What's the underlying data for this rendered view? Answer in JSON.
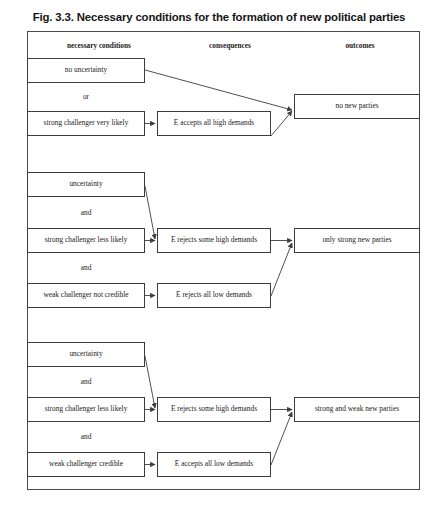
{
  "figure": {
    "title": "Fig. 3.3. Necessary conditions for the formation of new political parties"
  },
  "columns": [
    {
      "id": "necessary-conditions",
      "label": "necessary conditions",
      "x": 44,
      "y": 41,
      "w": 110
    },
    {
      "id": "consequences",
      "label": "consequences",
      "x": 175,
      "y": 41,
      "w": 110
    },
    {
      "id": "outcomes",
      "label": "outcomes",
      "x": 305,
      "y": 41,
      "w": 110
    }
  ],
  "frame": {
    "x": 27,
    "y": 31,
    "w": 393,
    "h": 459
  },
  "groups": [
    {
      "id": "group-1",
      "conditions": [
        {
          "id": "no-uncertainty",
          "text": "no uncertainty",
          "x": 27,
          "y": 58,
          "w": 118,
          "h": 25
        },
        {
          "id": "strong-challenger-very-likely",
          "text": "strong challenger very likely",
          "x": 27,
          "y": 111,
          "w": 118,
          "h": 25
        }
      ],
      "connector": {
        "id": "or-1",
        "text": "or",
        "x": 27,
        "y": 83,
        "w": 118,
        "h": 28
      },
      "consequences": [
        {
          "id": "e-accepts-all-high-demands",
          "text": "E accepts all high demands",
          "x": 157,
          "y": 111,
          "w": 114,
          "h": 25
        }
      ],
      "outcomes": [
        {
          "id": "no-new-parties",
          "text": "no new parties",
          "x": 294,
          "y": 94,
          "w": 126,
          "h": 25
        }
      ]
    },
    {
      "id": "group-2",
      "conditions": [
        {
          "id": "uncertainty-2",
          "text": "uncertainty",
          "x": 27,
          "y": 172,
          "w": 118,
          "h": 25
        },
        {
          "id": "strong-challenger-less-likely-2",
          "text": "strong challenger less likely",
          "x": 27,
          "y": 228,
          "w": 118,
          "h": 25
        },
        {
          "id": "weak-challenger-not-credible",
          "text": "weak challenger not credible",
          "x": 27,
          "y": 283,
          "w": 118,
          "h": 25
        }
      ],
      "connectors": [
        {
          "id": "and-2a",
          "text": "and",
          "x": 27,
          "y": 197,
          "w": 118,
          "h": 31
        },
        {
          "id": "and-2b",
          "text": "and",
          "x": 27,
          "y": 253,
          "w": 118,
          "h": 30
        }
      ],
      "consequences": [
        {
          "id": "e-rejects-some-high-demands-2",
          "text": "E rejects some high demands",
          "x": 157,
          "y": 228,
          "w": 114,
          "h": 25
        },
        {
          "id": "e-rejects-all-low-demands",
          "text": "E rejects all low demands",
          "x": 157,
          "y": 283,
          "w": 114,
          "h": 25
        }
      ],
      "outcomes": [
        {
          "id": "only-strong-new-parties",
          "text": "only strong new parties",
          "x": 294,
          "y": 228,
          "w": 126,
          "h": 25
        }
      ]
    },
    {
      "id": "group-3",
      "conditions": [
        {
          "id": "uncertainty-3",
          "text": "uncertainty",
          "x": 27,
          "y": 342,
          "w": 118,
          "h": 25
        },
        {
          "id": "strong-challenger-less-likely-3",
          "text": "strong challenger less likely",
          "x": 27,
          "y": 397,
          "w": 118,
          "h": 25
        },
        {
          "id": "weak-challenger-credible",
          "text": "weak challenger credible",
          "x": 27,
          "y": 452,
          "w": 118,
          "h": 25
        }
      ],
      "connectors": [
        {
          "id": "and-3a",
          "text": "and",
          "x": 27,
          "y": 367,
          "w": 118,
          "h": 30
        },
        {
          "id": "and-3b",
          "text": "and",
          "x": 27,
          "y": 422,
          "w": 118,
          "h": 30
        }
      ],
      "consequences": [
        {
          "id": "e-rejects-some-high-demands-3",
          "text": "E rejects some high demands",
          "x": 157,
          "y": 397,
          "w": 114,
          "h": 25
        },
        {
          "id": "e-accepts-all-low-demands",
          "text": "E accepts all low demands",
          "x": 157,
          "y": 452,
          "w": 114,
          "h": 25
        }
      ],
      "outcomes": [
        {
          "id": "strong-and-weak-new-parties",
          "text": "strong and weak new parties",
          "x": 294,
          "y": 397,
          "w": 126,
          "h": 25
        }
      ]
    }
  ],
  "edges": [
    {
      "id": "edge-no-uncertainty-to-no-new-parties",
      "from": "no-uncertainty",
      "to": "no-new-parties"
    },
    {
      "id": "edge-strong-very-likely-to-accepts-high",
      "from": "strong-challenger-very-likely",
      "to": "e-accepts-all-high-demands"
    },
    {
      "id": "edge-accepts-high-to-no-new-parties",
      "from": "e-accepts-all-high-demands",
      "to": "no-new-parties"
    },
    {
      "id": "edge-uncertainty2-to-rejects-some-high",
      "from": "uncertainty-2",
      "to": "e-rejects-some-high-demands-2"
    },
    {
      "id": "edge-strong-less-likely2-to-rejects-some-high",
      "from": "strong-challenger-less-likely-2",
      "to": "e-rejects-some-high-demands-2"
    },
    {
      "id": "edge-weak-not-credible-to-rejects-all-low",
      "from": "weak-challenger-not-credible",
      "to": "e-rejects-all-low-demands"
    },
    {
      "id": "edge-rejects-some-high-to-only-strong",
      "from": "e-rejects-some-high-demands-2",
      "to": "only-strong-new-parties"
    },
    {
      "id": "edge-rejects-all-low-to-only-strong",
      "from": "e-rejects-all-low-demands",
      "to": "only-strong-new-parties"
    },
    {
      "id": "edge-uncertainty3-to-rejects-some-high",
      "from": "uncertainty-3",
      "to": "e-rejects-some-high-demands-3"
    },
    {
      "id": "edge-strong-less-likely3-to-rejects-some-high",
      "from": "strong-challenger-less-likely-3",
      "to": "e-rejects-some-high-demands-3"
    },
    {
      "id": "edge-weak-credible-to-accepts-all-low",
      "from": "weak-challenger-credible",
      "to": "e-accepts-all-low-demands"
    },
    {
      "id": "edge-rejects-some-high3-to-strong-weak",
      "from": "e-rejects-some-high-demands-3",
      "to": "strong-and-weak-new-parties"
    },
    {
      "id": "edge-accepts-all-low-to-strong-weak",
      "from": "e-accepts-all-low-demands",
      "to": "strong-and-weak-new-parties"
    }
  ],
  "style": {
    "line_color": "#3d3d3d",
    "text_color": "#1c1c1c",
    "background": "#ffffff"
  }
}
